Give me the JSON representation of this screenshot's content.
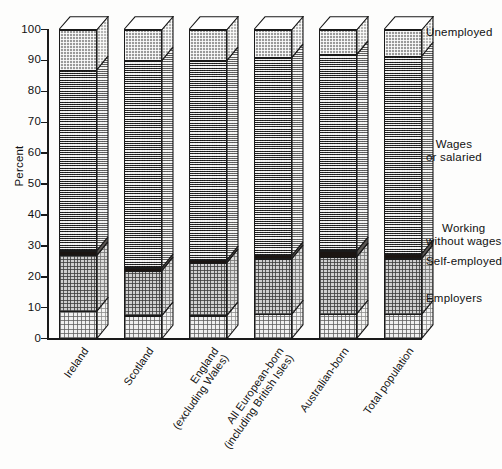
{
  "chart_data": {
    "type": "bar",
    "subtype": "stacked-100-percent-3d",
    "title": "",
    "xlabel": "",
    "ylabel": "Percent",
    "ylim": [
      0,
      100
    ],
    "yticks": [
      0,
      10,
      20,
      30,
      40,
      50,
      60,
      70,
      80,
      90,
      100
    ],
    "grid": false,
    "legend_position": "right-aligned-to-segments",
    "categories": [
      "Ireland",
      "Scotland",
      "England (excluding Wales)",
      "All European-born (including British Isles)",
      "Australian-born",
      "Total population"
    ],
    "series": [
      {
        "name": "Employers",
        "values": [
          9,
          7.5,
          7.5,
          8,
          8,
          8
        ]
      },
      {
        "name": "Self-employed",
        "values": [
          18,
          14.5,
          17,
          18,
          18.5,
          18
        ]
      },
      {
        "name": "Working without wages",
        "values": [
          1.5,
          1,
          1,
          1,
          2,
          1.5
        ]
      },
      {
        "name": "Wages or salaried",
        "values": [
          58.5,
          67,
          64.5,
          64,
          63.5,
          64
        ]
      },
      {
        "name": "Unemployed",
        "values": [
          13,
          10,
          10,
          9,
          8,
          8.5
        ]
      }
    ],
    "cumulative_boundaries": [
      {
        "category": "Ireland",
        "employers": 9,
        "self_employed": 27,
        "working_without_wages": 28.5,
        "wages_or_salaried": 87
      },
      {
        "category": "Scotland",
        "employers": 7.5,
        "self_employed": 22,
        "working_without_wages": 23,
        "wages_or_salaried": 90
      },
      {
        "category": "England (excluding Wales)",
        "employers": 7.5,
        "self_employed": 24.5,
        "working_without_wages": 25.5,
        "wages_or_salaried": 90
      },
      {
        "category": "All European-born (including British Isles)",
        "employers": 8,
        "self_employed": 26,
        "working_without_wages": 27,
        "wages_or_salaried": 91
      },
      {
        "category": "Australian-born",
        "employers": 8,
        "self_employed": 26.5,
        "working_without_wages": 28.5,
        "wages_or_salaried": 92
      },
      {
        "category": "Total population",
        "employers": 8,
        "self_employed": 26,
        "working_without_wages": 27.5,
        "wages_or_salaried": 91.5
      }
    ]
  },
  "axis": {
    "y_title": "Percent",
    "y_tick_labels": [
      "100",
      "90",
      "80",
      "70",
      "60",
      "50",
      "40",
      "30",
      "20",
      "10",
      "0"
    ]
  },
  "x_labels": [
    {
      "lines": [
        "Ireland"
      ]
    },
    {
      "lines": [
        "Scotland"
      ]
    },
    {
      "lines": [
        "England",
        "(excluding Wales)"
      ]
    },
    {
      "lines": [
        "All European-born",
        "(including British Isles)"
      ]
    },
    {
      "lines": [
        "Australian-born"
      ]
    },
    {
      "lines": [
        "Total population"
      ]
    }
  ],
  "legend": [
    {
      "key": "unemployed",
      "lines": [
        "Unemployed"
      ]
    },
    {
      "key": "wages",
      "lines": [
        "Wages",
        "or salaried"
      ]
    },
    {
      "key": "working",
      "lines": [
        "Working",
        "without wages"
      ]
    },
    {
      "key": "self",
      "lines": [
        "Self-employed"
      ]
    },
    {
      "key": "employers",
      "lines": [
        "Employers"
      ]
    }
  ],
  "colors": {
    "ink": "#1a1a1a",
    "unemployed": "#9a9a9a",
    "wages": "#8d8d8d",
    "working_without_wages": "#1b1512",
    "self_employed": "#cfcfcf",
    "employers": "#efefef",
    "background": "#fdfdfc"
  }
}
